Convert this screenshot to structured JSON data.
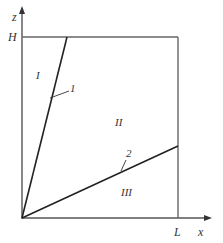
{
  "diagram": {
    "axes": {
      "z_label": "z",
      "x_label": "x",
      "h_label": "H",
      "l_label": "L"
    },
    "regions": [
      {
        "id": "region-1",
        "label": "I"
      },
      {
        "id": "region-2",
        "label": "II"
      },
      {
        "id": "region-3",
        "label": "III"
      }
    ],
    "lines": [
      {
        "id": "line-1",
        "label": "1"
      },
      {
        "id": "line-2",
        "label": "2"
      }
    ],
    "colors": {
      "line": "#222222",
      "axis": "#555555",
      "text": "#333333"
    }
  }
}
